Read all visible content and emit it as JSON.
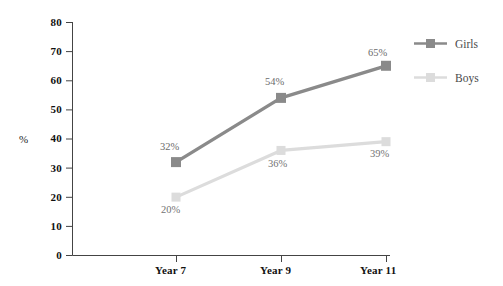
{
  "chart_data": {
    "type": "line",
    "title": "",
    "subtitle": "",
    "xlabel": "",
    "ylabel": "%",
    "categories": [
      "Year 7",
      "Year 9",
      "Year 11"
    ],
    "ylim": [
      0,
      80
    ],
    "ytick_step": 10,
    "yticks": [
      "0",
      "10",
      "20",
      "30",
      "40",
      "50",
      "60",
      "70",
      "80"
    ],
    "grid": false,
    "legend_position": "right",
    "series": [
      {
        "name": "Girls",
        "color": "#8a8a8a",
        "values": [
          32,
          54,
          65
        ],
        "labels": [
          "32%",
          "54%",
          "65%"
        ]
      },
      {
        "name": "Boys",
        "color": "#dcdcdc",
        "values": [
          20,
          36,
          39
        ],
        "labels": [
          "20%",
          "36%",
          "39%"
        ]
      }
    ]
  },
  "axes": {
    "y_axis_title": "%",
    "y_tick_labels": [
      "80",
      "70",
      "60",
      "50",
      "40",
      "30",
      "20",
      "10",
      "0"
    ],
    "x_tick_labels": [
      "Year 7",
      "Year 9",
      "Year 11"
    ]
  },
  "legend": {
    "entries": [
      {
        "label": "Girls",
        "color": "#8a8a8a"
      },
      {
        "label": "Boys",
        "color": "#dcdcdc"
      }
    ]
  },
  "data_labels": {
    "girls": [
      "32%",
      "54%",
      "65%"
    ],
    "boys": [
      "20%",
      "36%",
      "39%"
    ]
  },
  "colors": {
    "background": "#ffffff",
    "axis": "#444444",
    "girls": "#8a8a8a",
    "boys": "#dcdcdc",
    "label_text": "#5e5e5e",
    "tick_text": "#111111"
  }
}
